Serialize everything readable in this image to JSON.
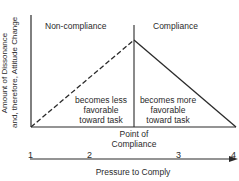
{
  "diagram": {
    "y_axis_label_line1": "Amount of Dissonance",
    "y_axis_label_line2": "and, therefore, Attitude Change",
    "region_left_title": "Non-compliance",
    "region_right_title": "Compliance",
    "left_region_text": [
      "becomes less",
      "favorable",
      "toward task"
    ],
    "right_region_text": [
      "becomes more",
      "favorable",
      "toward task"
    ],
    "point_label_line1": "Point of",
    "point_label_line2": "Compliance",
    "scale_ticks": [
      "1",
      "2",
      "3",
      "4"
    ],
    "x_axis_label": "Pressure to Comply",
    "colors": {
      "line": "#2a2a2a",
      "background": "#ffffff"
    }
  }
}
